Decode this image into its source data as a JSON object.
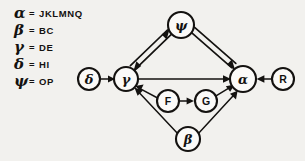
{
  "figure": {
    "background_color": "#f2f1ee",
    "ink_color": "#141210"
  },
  "legend": {
    "name": "symbol-definition-legend",
    "separator": "=",
    "entries": [
      {
        "symbol": "α",
        "symbol_name": "alpha",
        "value": "JKLMNQ"
      },
      {
        "symbol": "β",
        "symbol_name": "beta",
        "value": "BC"
      },
      {
        "symbol": "γ",
        "symbol_name": "gamma",
        "value": "DE"
      },
      {
        "symbol": "δ",
        "symbol_name": "delta",
        "value": "HI"
      },
      {
        "symbol": "ψ",
        "symbol_name": "psi",
        "value": "OP"
      }
    ]
  },
  "graph": {
    "type": "directed-graph",
    "nodes": [
      {
        "id": "delta",
        "label": "δ",
        "kind": "greek",
        "x": 89,
        "y": 79,
        "r": 11
      },
      {
        "id": "gamma",
        "label": "γ",
        "kind": "greek",
        "x": 126,
        "y": 79,
        "r": 12
      },
      {
        "id": "psi",
        "label": "ψ",
        "kind": "greek",
        "x": 181,
        "y": 25,
        "r": 13
      },
      {
        "id": "alpha",
        "label": "α",
        "kind": "greek",
        "x": 243,
        "y": 79,
        "r": 13
      },
      {
        "id": "R",
        "label": "R",
        "kind": "latin",
        "x": 283,
        "y": 79,
        "r": 11
      },
      {
        "id": "F",
        "label": "F",
        "kind": "latin",
        "x": 168,
        "y": 101,
        "r": 11
      },
      {
        "id": "G",
        "label": "G",
        "kind": "latin",
        "x": 206,
        "y": 101,
        "r": 11
      },
      {
        "id": "beta",
        "label": "β",
        "kind": "greek",
        "x": 188,
        "y": 139,
        "r": 12
      }
    ],
    "edges": [
      {
        "from": "delta",
        "to": "gamma",
        "style": "single"
      },
      {
        "from": "gamma",
        "to": "psi",
        "style": "double"
      },
      {
        "from": "psi",
        "to": "gamma",
        "style": "double"
      },
      {
        "from": "psi",
        "to": "alpha",
        "style": "double"
      },
      {
        "from": "gamma",
        "to": "alpha",
        "style": "single"
      },
      {
        "from": "F",
        "to": "gamma",
        "style": "single"
      },
      {
        "from": "F",
        "to": "G",
        "style": "single"
      },
      {
        "from": "G",
        "to": "alpha",
        "style": "single"
      },
      {
        "from": "beta",
        "to": "gamma",
        "style": "single"
      },
      {
        "from": "beta",
        "to": "alpha",
        "style": "single"
      },
      {
        "from": "R",
        "to": "alpha",
        "style": "single"
      }
    ]
  }
}
